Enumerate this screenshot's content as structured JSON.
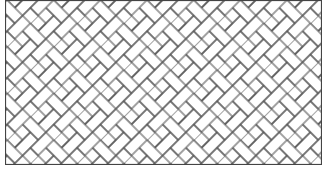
{
  "figure": {
    "line_color": "#555555",
    "background_color": "#ffffff",
    "frame": {
      "x": 5,
      "y": 0,
      "width": 317,
      "height": 165
    },
    "brick": {
      "long": 22,
      "short": 11,
      "angle_deg": 45
    }
  }
}
